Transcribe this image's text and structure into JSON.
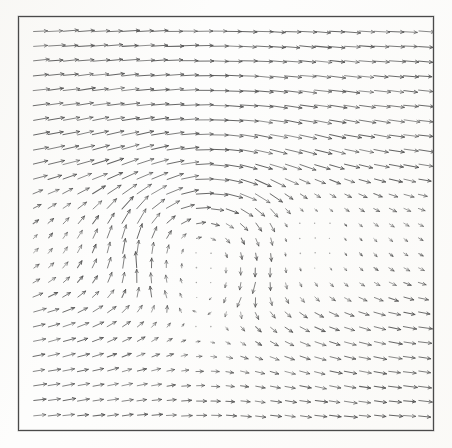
{
  "figure": {
    "title": "",
    "background_color": "#fdfdfc",
    "frame_color": "#4a4a4a",
    "arrow_color": "#555555"
  },
  "plot_area": {
    "left_px": 18,
    "top_px": 16,
    "width_px": 416,
    "height_px": 415
  },
  "chart_data": {
    "type": "scatter",
    "subtype": "quiver",
    "title": "",
    "subtitle": "",
    "xlabel": "",
    "ylabel": "",
    "xlim": [
      0,
      1
    ],
    "ylim": [
      0,
      1
    ],
    "xticks": [],
    "yticks": [],
    "xticklabels": [],
    "yticklabels": [],
    "grid": false,
    "legend": null,
    "legend_position": "none",
    "annotations": [],
    "grid_nx": 27,
    "grid_ny": 27,
    "arrow_scale": 13.5,
    "arrow_head_length": 3.4,
    "arrow_head_width": 2.2,
    "line_width": 0.85,
    "vortex": {
      "center_x": 0.44,
      "center_y": 0.46,
      "strength": 0.55,
      "core_radius": 0.17,
      "rotation": "clockwise"
    },
    "stagnation_region": {
      "center_x": 0.71,
      "center_y": 0.46,
      "radius": 0.17,
      "mean_speed": 0.04
    },
    "background_flow": {
      "u": 1.0,
      "v": 0.0,
      "direction_deg": 0
    },
    "shear_layer": {
      "y_upper": 0.64,
      "y_lower": 0.27
    },
    "speed_range": [
      0.0,
      1.15
    ]
  }
}
